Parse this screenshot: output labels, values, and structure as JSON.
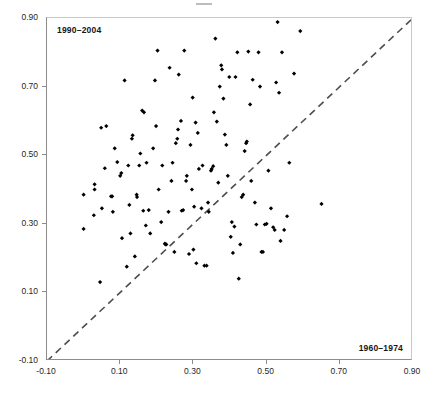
{
  "figure": {
    "background_color": "#ffffff",
    "marker_color": "#000000",
    "axis_color": "#8c8c8c",
    "reference_line_color": "#4d4d4d"
  },
  "labels": {
    "y_series": "1990–2004",
    "x_series": "1960–1974"
  },
  "axes": {
    "x_ticks": [
      "-0.10",
      "0.10",
      "0.30",
      "0.50",
      "0.70",
      "0.90"
    ],
    "y_ticks": [
      "-0.10",
      "0.10",
      "0.30",
      "0.50",
      "0.70",
      "0.90"
    ]
  },
  "chart_data": {
    "type": "scatter",
    "title": "",
    "xlabel": "1960–1974",
    "ylabel": "1990–2004",
    "xlim": [
      -0.1,
      0.9
    ],
    "ylim": [
      -0.1,
      0.9
    ],
    "x_tick_values": [
      -0.1,
      0.1,
      0.3,
      0.5,
      0.7,
      0.9
    ],
    "y_tick_values": [
      -0.1,
      0.1,
      0.3,
      0.5,
      0.7,
      0.9
    ],
    "grid": false,
    "legend": "none",
    "annotations": [
      {
        "text": "1990–2004",
        "position": "top-left-inside"
      },
      {
        "text": "1960–1974",
        "position": "bottom-right-inside"
      }
    ],
    "reference_line": {
      "type": "identity",
      "style": "dashed",
      "from": [
        -0.1,
        -0.1
      ],
      "to": [
        0.9,
        0.9
      ]
    },
    "series": [
      {
        "name": "countries",
        "marker": "diamond",
        "color": "#000000",
        "points": [
          [
            0.0,
            0.285
          ],
          [
            0.0,
            0.385
          ],
          [
            0.028,
            0.325
          ],
          [
            0.03,
            0.4
          ],
          [
            0.03,
            0.415
          ],
          [
            0.045,
            0.13
          ],
          [
            0.048,
            0.58
          ],
          [
            0.05,
            0.345
          ],
          [
            0.058,
            0.462
          ],
          [
            0.062,
            0.585
          ],
          [
            0.075,
            0.38
          ],
          [
            0.078,
            0.38
          ],
          [
            0.08,
            0.335
          ],
          [
            0.085,
            0.52
          ],
          [
            0.092,
            0.48
          ],
          [
            0.1,
            0.44
          ],
          [
            0.103,
            0.448
          ],
          [
            0.105,
            0.258
          ],
          [
            0.112,
            0.718
          ],
          [
            0.118,
            0.175
          ],
          [
            0.122,
            0.47
          ],
          [
            0.125,
            0.355
          ],
          [
            0.128,
            0.272
          ],
          [
            0.132,
            0.548
          ],
          [
            0.134,
            0.558
          ],
          [
            0.14,
            0.205
          ],
          [
            0.145,
            0.385
          ],
          [
            0.146,
            0.378
          ],
          [
            0.152,
            0.47
          ],
          [
            0.155,
            0.505
          ],
          [
            0.16,
            0.63
          ],
          [
            0.163,
            0.338
          ],
          [
            0.165,
            0.625
          ],
          [
            0.17,
            0.295
          ],
          [
            0.172,
            0.478
          ],
          [
            0.178,
            0.34
          ],
          [
            0.182,
            0.272
          ],
          [
            0.19,
            0.52
          ],
          [
            0.195,
            0.718
          ],
          [
            0.198,
            0.585
          ],
          [
            0.202,
            0.805
          ],
          [
            0.205,
            0.4
          ],
          [
            0.212,
            0.305
          ],
          [
            0.215,
            0.47
          ],
          [
            0.222,
            0.242
          ],
          [
            0.224,
            0.24
          ],
          [
            0.226,
            0.24
          ],
          [
            0.232,
            0.335
          ],
          [
            0.235,
            0.755
          ],
          [
            0.24,
            0.425
          ],
          [
            0.243,
            0.478
          ],
          [
            0.248,
            0.218
          ],
          [
            0.252,
            0.535
          ],
          [
            0.256,
            0.548
          ],
          [
            0.258,
            0.575
          ],
          [
            0.26,
            0.735
          ],
          [
            0.266,
            0.6
          ],
          [
            0.268,
            0.338
          ],
          [
            0.272,
            0.34
          ],
          [
            0.275,
            0.805
          ],
          [
            0.28,
            0.425
          ],
          [
            0.282,
            0.44
          ],
          [
            0.288,
            0.212
          ],
          [
            0.292,
            0.53
          ],
          [
            0.296,
            0.4
          ],
          [
            0.298,
            0.668
          ],
          [
            0.3,
            0.225
          ],
          [
            0.302,
            0.35
          ],
          [
            0.306,
            0.595
          ],
          [
            0.308,
            0.185
          ],
          [
            0.312,
            0.565
          ],
          [
            0.315,
            0.46
          ],
          [
            0.322,
            0.345
          ],
          [
            0.325,
            0.47
          ],
          [
            0.33,
            0.178
          ],
          [
            0.336,
            0.178
          ],
          [
            0.34,
            0.362
          ],
          [
            0.342,
            0.335
          ],
          [
            0.348,
            0.455
          ],
          [
            0.35,
            0.46
          ],
          [
            0.354,
            0.468
          ],
          [
            0.356,
            0.625
          ],
          [
            0.36,
            0.84
          ],
          [
            0.364,
            0.598
          ],
          [
            0.368,
            0.42
          ],
          [
            0.372,
            0.7
          ],
          [
            0.376,
            0.762
          ],
          [
            0.378,
            0.75
          ],
          [
            0.382,
            0.665
          ],
          [
            0.386,
            0.56
          ],
          [
            0.39,
            0.53
          ],
          [
            0.394,
            0.44
          ],
          [
            0.398,
            0.728
          ],
          [
            0.402,
            0.262
          ],
          [
            0.405,
            0.305
          ],
          [
            0.408,
            0.215
          ],
          [
            0.412,
            0.292
          ],
          [
            0.415,
            0.728
          ],
          [
            0.42,
            0.8
          ],
          [
            0.424,
            0.14
          ],
          [
            0.428,
            0.24
          ],
          [
            0.432,
            0.378
          ],
          [
            0.436,
            0.385
          ],
          [
            0.44,
            0.512
          ],
          [
            0.444,
            0.535
          ],
          [
            0.446,
            0.54
          ],
          [
            0.45,
            0.802
          ],
          [
            0.455,
            0.648
          ],
          [
            0.458,
            0.425
          ],
          [
            0.462,
            0.72
          ],
          [
            0.468,
            0.362
          ],
          [
            0.472,
            0.298
          ],
          [
            0.478,
            0.8
          ],
          [
            0.482,
            0.7
          ],
          [
            0.486,
            0.218
          ],
          [
            0.49,
            0.218
          ],
          [
            0.495,
            0.298
          ],
          [
            0.5,
            0.3
          ],
          [
            0.505,
            0.455
          ],
          [
            0.512,
            0.345
          ],
          [
            0.518,
            0.29
          ],
          [
            0.522,
            0.282
          ],
          [
            0.526,
            0.712
          ],
          [
            0.53,
            0.888
          ],
          [
            0.534,
            0.682
          ],
          [
            0.538,
            0.25
          ],
          [
            0.542,
            0.8
          ],
          [
            0.548,
            0.282
          ],
          [
            0.556,
            0.322
          ],
          [
            0.562,
            0.478
          ],
          [
            0.575,
            0.738
          ],
          [
            0.592,
            0.862
          ],
          [
            0.65,
            0.358
          ]
        ]
      }
    ]
  }
}
